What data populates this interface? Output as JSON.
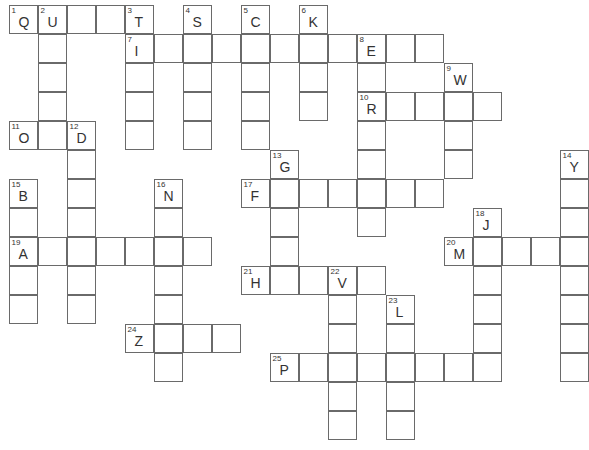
{
  "puzzle": {
    "cell_size": 29,
    "origin": {
      "x": 9,
      "y": 5
    },
    "entries": [
      {
        "number": "1",
        "hint_letter": "Q",
        "direction": "across",
        "row": 0,
        "col": 0,
        "length": 5
      },
      {
        "number": "2",
        "hint_letter": "U",
        "direction": "down",
        "row": 0,
        "col": 1,
        "length": 4
      },
      {
        "number": "3",
        "hint_letter": "T",
        "direction": "down",
        "row": 0,
        "col": 4,
        "length": 5
      },
      {
        "number": "4",
        "hint_letter": "S",
        "direction": "down",
        "row": 0,
        "col": 6,
        "length": 5
      },
      {
        "number": "5",
        "hint_letter": "C",
        "direction": "down",
        "row": 0,
        "col": 8,
        "length": 5
      },
      {
        "number": "6",
        "hint_letter": "K",
        "direction": "down",
        "row": 0,
        "col": 10,
        "length": 4
      },
      {
        "number": "7",
        "hint_letter": "I",
        "direction": "across",
        "row": 1,
        "col": 4,
        "length": 11
      },
      {
        "number": "8",
        "hint_letter": "E",
        "direction": "down",
        "row": 1,
        "col": 12,
        "length": 7
      },
      {
        "number": "9",
        "hint_letter": "W",
        "direction": "down",
        "row": 2,
        "col": 15,
        "length": 4
      },
      {
        "number": "10",
        "hint_letter": "R",
        "direction": "across",
        "row": 3,
        "col": 12,
        "length": 5
      },
      {
        "number": "11",
        "hint_letter": "O",
        "direction": "across",
        "row": 4,
        "col": 0,
        "length": 3
      },
      {
        "number": "12",
        "hint_letter": "D",
        "direction": "down",
        "row": 4,
        "col": 2,
        "length": 7
      },
      {
        "number": "13",
        "hint_letter": "G",
        "direction": "down",
        "row": 5,
        "col": 9,
        "length": 4
      },
      {
        "number": "14",
        "hint_letter": "Y",
        "direction": "down",
        "row": 5,
        "col": 19,
        "length": 8
      },
      {
        "number": "15",
        "hint_letter": "B",
        "direction": "down",
        "row": 6,
        "col": 0,
        "length": 5
      },
      {
        "number": "16",
        "hint_letter": "N",
        "direction": "down",
        "row": 6,
        "col": 5,
        "length": 7
      },
      {
        "number": "17",
        "hint_letter": "F",
        "direction": "across",
        "row": 6,
        "col": 8,
        "length": 7
      },
      {
        "number": "18",
        "hint_letter": "J",
        "direction": "down",
        "row": 7,
        "col": 16,
        "length": 6
      },
      {
        "number": "19",
        "hint_letter": "A",
        "direction": "across",
        "row": 8,
        "col": 0,
        "length": 7
      },
      {
        "number": "20",
        "hint_letter": "M",
        "direction": "across",
        "row": 8,
        "col": 15,
        "length": 5
      },
      {
        "number": "21",
        "hint_letter": "H",
        "direction": "across",
        "row": 9,
        "col": 8,
        "length": 5
      },
      {
        "number": "22",
        "hint_letter": "V",
        "direction": "down",
        "row": 9,
        "col": 11,
        "length": 6
      },
      {
        "number": "23",
        "hint_letter": "L",
        "direction": "down",
        "row": 10,
        "col": 13,
        "length": 5
      },
      {
        "number": "24",
        "hint_letter": "Z",
        "direction": "across",
        "row": 11,
        "col": 4,
        "length": 4
      },
      {
        "number": "25",
        "hint_letter": "P",
        "direction": "across",
        "row": 12,
        "col": 9,
        "length": 8
      }
    ]
  },
  "colors": {
    "border": "#6a6a6a",
    "text": "#333333",
    "background": "#ffffff"
  }
}
